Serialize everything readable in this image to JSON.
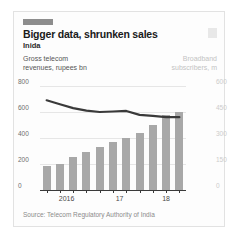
{
  "card": {
    "brand_bar": "economist-red-tab",
    "logo": "publication-logo"
  },
  "header": {
    "title": "Bigger data, shrunken sales",
    "subtitle": "Inida"
  },
  "captions": {
    "left": "Gross telecom\nrevenues, rupees bn",
    "left_line1": "Gross telecom",
    "left_line2": "revenues, rupees bn",
    "right_line1": "Broadband",
    "right_line2": "subscribers, m"
  },
  "source": "Source: Telecom Regulatory Authority of India",
  "colors": {
    "bar": "#a8a8a8",
    "line": "#3a3a3a",
    "grid": "#e6e6e6",
    "axis": "#3a3a3a",
    "right_axis_text": "#cccccc",
    "left_axis_text": "#6e6e6e"
  },
  "chart_data": {
    "type": "bar",
    "title": "Bigger data, shrunken sales",
    "subtitle": "Inida",
    "xlabel": "",
    "ylabel": "Gross telecom revenues, rupees bn",
    "y2label": "Broadband subscribers, m",
    "grid": true,
    "legend": "none",
    "categories": [
      "2016 Q1",
      "2016 Q2",
      "2016 Q3",
      "2016 Q4",
      "2017 Q1",
      "2017 Q2",
      "2017 Q3",
      "2017 Q4",
      "2018 Q1",
      "2018 Q2",
      "2018 Q3"
    ],
    "x_tick_labels": [
      "2016",
      "17",
      "18"
    ],
    "x_tick_label_positions": [
      1.5,
      5.5,
      9.0
    ],
    "ylim": [
      0,
      800
    ],
    "y_ticks": [
      0,
      200,
      400,
      600,
      800
    ],
    "y2lim": [
      0,
      600
    ],
    "y2_ticks": [
      0,
      150,
      300,
      450,
      600
    ],
    "series": [
      {
        "name": "Broadband subscribers, m",
        "type": "bar",
        "axis": "right",
        "color": "#a8a8a8",
        "values": [
          136,
          150,
          192,
          218,
          250,
          276,
          300,
          330,
          375,
          430,
          448
        ]
      },
      {
        "name": "Gross telecom revenues, rupees bn",
        "type": "line",
        "axis": "left",
        "color": "#3a3a3a",
        "values": [
          690,
          660,
          630,
          610,
          600,
          604,
          608,
          578,
          570,
          560,
          560
        ]
      }
    ]
  }
}
